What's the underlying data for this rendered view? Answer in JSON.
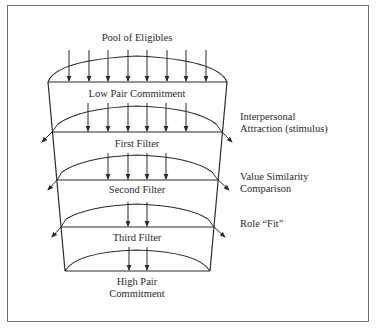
{
  "diagram": {
    "title_top": "Pool of Eligibles",
    "stages": [
      {
        "id": "low",
        "label": "Low Pair Commitment"
      },
      {
        "id": "first",
        "label": "First Filter"
      },
      {
        "id": "second",
        "label": "Second Filter"
      },
      {
        "id": "third",
        "label": "Third Filter"
      },
      {
        "id": "high",
        "label_line1": "High Pair",
        "label_line2": "Commitment"
      }
    ],
    "filters": [
      {
        "line1": "Interpersonal",
        "line2": "Attraction (stimulus)"
      },
      {
        "line1": "Value Similarity",
        "line2": "Comparison"
      },
      {
        "line1": "Role “Fit”"
      }
    ],
    "arrow_counts": {
      "pool_of_eligibles": 8,
      "first_filter": 6,
      "second_filter": 4,
      "third_filter": 2,
      "high_pair": 2
    },
    "colors": {
      "line": "#2b2b2b",
      "frame": "#6d6d6d",
      "background": "#ffffff"
    }
  }
}
